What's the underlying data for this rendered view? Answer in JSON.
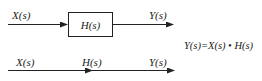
{
  "block_diagram": {
    "input_label": "X(s)",
    "block_label": "H(s)",
    "output_label": "Y(s)"
  },
  "signal_flow_graph": {
    "input_label": "X(s)",
    "branch_label": "H(s)",
    "output_label": "Y(s)"
  },
  "equation": "Y(s)=X(s) • H(s)",
  "colors": {
    "stroke": "#222222",
    "background": "#ffffff"
  }
}
